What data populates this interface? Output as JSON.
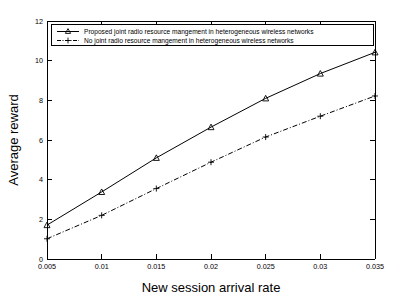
{
  "chart_data": {
    "type": "line",
    "title": "",
    "xlabel": "New session arrival rate",
    "ylabel": "Average reward",
    "x": [
      0.005,
      0.01,
      0.015,
      0.02,
      0.025,
      0.03,
      0.035
    ],
    "xticklabels": [
      "0.005",
      "0.01",
      "0.015",
      "0.02",
      "0.025",
      "0.03",
      "0.035"
    ],
    "yticklabels": [
      "0",
      "2",
      "4",
      "6",
      "8",
      "10",
      "12"
    ],
    "yticks": [
      0,
      2,
      4,
      6,
      8,
      10,
      12
    ],
    "xlim": [
      0.005,
      0.035
    ],
    "ylim": [
      0,
      12
    ],
    "grid": false,
    "legend_position": "top-left",
    "series": [
      {
        "name": "Proposed joint radio resource mangement in heterogeneous wireless networks",
        "values": [
          1.71,
          3.38,
          5.1,
          6.65,
          8.1,
          9.35,
          10.42
        ],
        "marker": "triangle",
        "linestyle": "solid",
        "color": "#000000"
      },
      {
        "name": "No joint radio resource mangement in heterogeneous wireless networks",
        "values": [
          1.02,
          2.2,
          3.55,
          4.88,
          6.15,
          7.2,
          8.22
        ],
        "marker": "plus",
        "linestyle": "dashdot",
        "color": "#000000"
      }
    ]
  },
  "axes": {
    "x_label": "New session arrival rate",
    "y_label": "Average reward"
  }
}
